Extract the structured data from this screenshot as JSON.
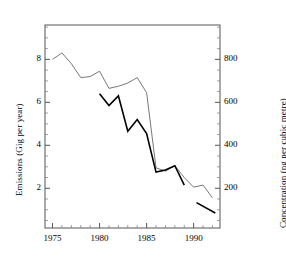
{
  "chart_data": {
    "type": "line",
    "title": "",
    "xlabel": "",
    "ylabel": "Emissions (Gig per year)",
    "y2label": "Concentration (ng per cubic metre)",
    "xlim": [
      1974.2,
      1992.8
    ],
    "ylim": [
      0.15,
      9.6
    ],
    "y2lim": [
      15,
      960
    ],
    "grid": false,
    "legend": null,
    "xticks": [
      1975,
      1980,
      1985,
      1990
    ],
    "xtick_labels": [
      "1975",
      "1980",
      "1985",
      "1990"
    ],
    "yticks": [
      2,
      4,
      6,
      8
    ],
    "ytick_labels": [
      "2",
      "4",
      "6",
      "8"
    ],
    "y2ticks": [
      200,
      400,
      600,
      800
    ],
    "y2tick_labels": [
      "200",
      "400",
      "600",
      "800"
    ],
    "series": [
      {
        "name": "Emissions",
        "axis": "left",
        "style": "thin",
        "color": "#555555",
        "width": 0.8,
        "x": [
          1975,
          1976,
          1977,
          1978,
          1979,
          1980,
          1981,
          1982,
          1983,
          1984,
          1985,
          1986,
          1987,
          1988,
          1989,
          1990,
          1991,
          1992
        ],
        "y": [
          8.0,
          8.3,
          7.8,
          7.15,
          7.2,
          7.45,
          6.65,
          6.75,
          6.9,
          7.15,
          6.45,
          2.95,
          2.8,
          3.05,
          2.5,
          2.05,
          2.15,
          1.55
        ]
      },
      {
        "name": "Concentration",
        "axis": "right",
        "style": "thick",
        "color": "#000000",
        "width": 1.6,
        "x": [
          1980,
          1981,
          1982,
          1983,
          1984,
          1985,
          1986,
          1987,
          1988,
          1989
        ],
        "y": [
          640,
          585,
          630,
          465,
          520,
          455,
          275,
          285,
          305,
          215
        ]
      },
      {
        "name": "Concentration (late segment)",
        "axis": "right",
        "style": "thick",
        "color": "#000000",
        "width": 1.6,
        "x": [
          1990.3,
          1992.3
        ],
        "y": [
          133,
          85
        ]
      }
    ]
  }
}
